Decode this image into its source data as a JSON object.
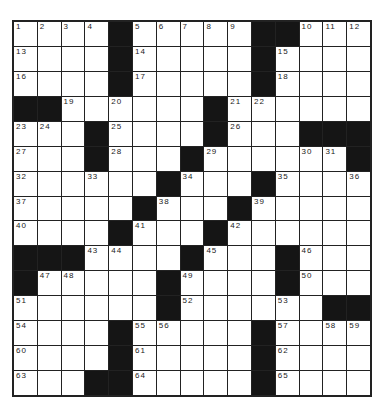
{
  "puzzle": {
    "rows": 15,
    "cols": 15,
    "colors": {
      "block": "#151515",
      "cell": "#ffffff",
      "line": "#222222"
    },
    "grid": [
      [
        "1",
        "2",
        "3",
        "4",
        "#",
        "5",
        "6",
        "7",
        "8",
        "9",
        "#",
        "#",
        "10",
        "11",
        "12"
      ],
      [
        "13",
        "",
        "",
        "",
        "#",
        "14",
        "",
        "",
        "",
        "",
        "#",
        "15",
        "",
        "",
        ""
      ],
      [
        "16",
        "",
        "",
        "",
        "#",
        "17",
        "",
        "",
        "",
        "",
        "#",
        "18",
        "",
        "",
        ""
      ],
      [
        "#",
        "#",
        "19",
        "",
        "20",
        "",
        "",
        "",
        "#",
        "21",
        "22",
        "",
        "",
        "",
        ""
      ],
      [
        "23",
        "24",
        "",
        "#",
        "25",
        "",
        "",
        "",
        "#",
        "26",
        "",
        "",
        "#",
        "#",
        "#"
      ],
      [
        "27",
        "",
        "",
        "#",
        "28",
        "",
        "",
        "#",
        "29",
        "",
        "",
        "",
        "30",
        "31",
        "#"
      ],
      [
        "32",
        "",
        "",
        "33",
        "",
        "",
        "#",
        "34",
        "",
        "",
        "#",
        "35",
        "",
        "",
        "36"
      ],
      [
        "37",
        "",
        "",
        "",
        "",
        "#",
        "38",
        "",
        "",
        "#",
        "39",
        "",
        "",
        "",
        ""
      ],
      [
        "40",
        "",
        "",
        "",
        "#",
        "41",
        "",
        "",
        "#",
        "42",
        "",
        "",
        "",
        "",
        ""
      ],
      [
        "#",
        "#",
        "#",
        "43",
        "44",
        "",
        "",
        "#",
        "45",
        "",
        "",
        "#",
        "46",
        "",
        ""
      ],
      [
        "#",
        "47",
        "48",
        "",
        "",
        "",
        "#",
        "49",
        "",
        "",
        "",
        "#",
        "50",
        "",
        ""
      ],
      [
        "51",
        "",
        "",
        "",
        "",
        "",
        "#",
        "52",
        "",
        "",
        "",
        "53",
        "",
        "#",
        "#"
      ],
      [
        "54",
        "",
        "",
        "",
        "#",
        "55",
        "56",
        "",
        "",
        "",
        "#",
        "57",
        "",
        "58",
        "59"
      ],
      [
        "60",
        "",
        "",
        "",
        "#",
        "61",
        "",
        "",
        "",
        "",
        "#",
        "62",
        "",
        "",
        ""
      ],
      [
        "63",
        "",
        "",
        "#",
        "#",
        "64",
        "",
        "",
        "",
        "",
        "#",
        "65",
        "",
        "",
        ""
      ]
    ]
  }
}
